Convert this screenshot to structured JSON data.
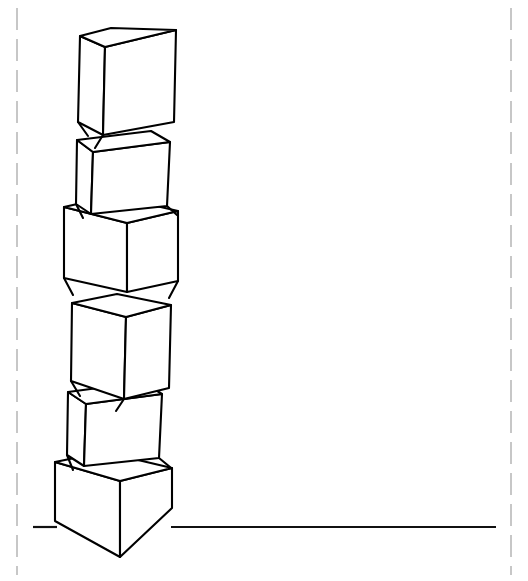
{
  "canvas": {
    "width": 528,
    "height": 581,
    "background_color": "#ffffff",
    "title": "Stack of six cubes line drawing"
  },
  "style": {
    "line_color": "#000000",
    "face_fill": "#ffffff",
    "line_width": 2.1,
    "guide_color": "#9a9a9a",
    "guide_dash": "22 9"
  },
  "guides": {
    "left_margin_x": 17,
    "right_margin_x": 511,
    "top_y": 8,
    "bottom_y": 575
  },
  "ground": {
    "label": "ground-line",
    "y": 527,
    "x_start": 33,
    "x_end": 496,
    "gap_x_start": 168,
    "gap_x_end": 172
  },
  "stack": {
    "count": 6,
    "description": "Six cubes stacked vertically, each rotated at a different angle, resting on a horizontal ground line",
    "cubes": [
      {
        "index": 1,
        "name": "cube-top",
        "orientation": "three-quarter-left",
        "faces": {
          "top": "80,36 111,28 176,30 148,44",
          "front": "105,47 176,30 174,122 103,135",
          "left": "80,36 105,47 103,135 78,122"
        },
        "extra_edges": [
          "78,122 87,134",
          "103,135 96,146"
        ]
      },
      {
        "index": 2,
        "name": "cube-2",
        "orientation": "front-facing-slight-tilt",
        "faces": {
          "top": "77,140 151,131 170,142 93,152",
          "front": "77,140 93,152 91,214 76,204",
          "right": "93,152 170,142 167,206 91,214"
        },
        "extra_edges": [
          "167,206 176,214",
          "76,204 82,216"
        ]
      },
      {
        "index": 3,
        "name": "cube-3",
        "orientation": "corner-facing",
        "faces": {
          "top": "64,207 113,196 178,211 127,223",
          "left": "64,207 127,223 127,292 64,278",
          "right": "127,223 178,211 178,281 127,292"
        },
        "extra_edges": [
          "64,278 72,293",
          "178,281 170,296"
        ]
      },
      {
        "index": 4,
        "name": "cube-4",
        "orientation": "three-quarter-left",
        "faces": {
          "top": "72,303 117,294 171,305 126,317"
        },
        "faces2": {
          "front": "126,317 171,305 169,388 124,399",
          "left": "72,303 126,317 124,399 71,381"
        },
        "extra_edges": [
          "71,381 79,394",
          "124,399 117,409"
        ]
      },
      {
        "index": 5,
        "name": "cube-5",
        "orientation": "front-facing-slight-tilt",
        "faces": {
          "top": "68,392 143,382 162,394 86,404",
          "front": "68,392 86,404 84,466 67,455",
          "right": "86,404 162,394 159,458 84,466"
        },
        "extra_edges": [
          "159,458 169,466",
          "67,455 73,468"
        ]
      },
      {
        "index": 6,
        "name": "cube-bottom",
        "orientation": "corner-facing",
        "faces": {
          "top": "55,462 104,452 172,468 120,481",
          "left": "55,462 120,481 120,557 55,521",
          "right": "120,481 172,468 172,508 120,557"
        },
        "extra_edges": []
      }
    ]
  }
}
